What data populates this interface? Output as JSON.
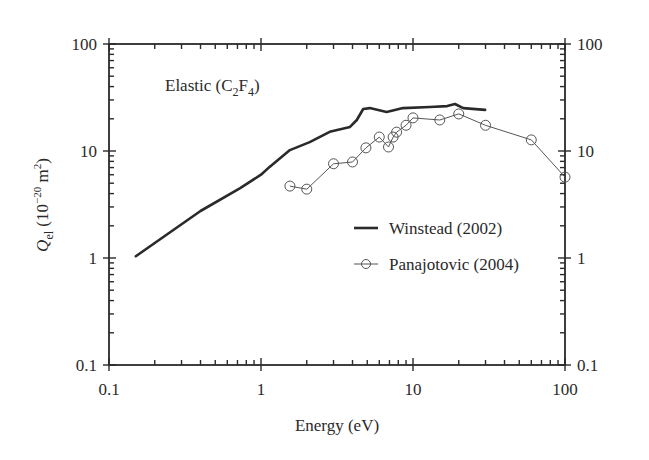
{
  "chart_data": {
    "type": "line",
    "title": "",
    "annotation": {
      "text": "Elastic (C",
      "sub1": "2",
      "mid": "F",
      "sub2": "4",
      "end": ")"
    },
    "xlabel": "Energy (eV)",
    "ylabel": {
      "symbol": "Q",
      "subscript": "el",
      "units_pre": " (10",
      "units_exp": "−20",
      "units_mid": " m",
      "units_exp2": "2",
      "units_end": ")"
    },
    "xscale": "log",
    "yscale": "log",
    "xlim": [
      0.1,
      100
    ],
    "ylim": [
      0.1,
      100
    ],
    "x_ticks": [
      "0.1",
      "1",
      "10",
      "100"
    ],
    "y_ticks": [
      "0.1",
      "1",
      "10",
      "100"
    ],
    "y_ticks_right": [
      "0.1",
      "1",
      "10",
      "100"
    ],
    "grid": false,
    "legend_position": "center-right",
    "series": [
      {
        "name": "Winstead (2002)",
        "style": "solid-thick",
        "color": "#2a2a2a",
        "x": [
          0.15,
          0.4,
          0.73,
          1.0,
          1.14,
          1.55,
          2.09,
          2.83,
          3.85,
          4.27,
          4.7,
          5.2,
          6.7,
          8.6,
          12.9,
          16.8,
          18.9,
          21.4,
          29.8
        ],
        "y": [
          1.04,
          2.75,
          4.5,
          6.0,
          7.1,
          10.2,
          12.1,
          15.1,
          16.8,
          19.5,
          24.7,
          25.2,
          23.2,
          25.2,
          25.8,
          26.3,
          27.5,
          25.2,
          24.2
        ]
      },
      {
        "name": "Panajotovic (2004)",
        "style": "thin-line-open-circles",
        "color": "#555555",
        "x": [
          1.55,
          2.0,
          3.0,
          4.0,
          4.9,
          6.0,
          6.9,
          7.4,
          7.8,
          9.0,
          10.0,
          15.0,
          20.0,
          30.0,
          60.0,
          100.0
        ],
        "y": [
          4.7,
          4.4,
          7.6,
          7.9,
          10.7,
          13.5,
          10.9,
          13.5,
          15.0,
          17.4,
          20.4,
          19.5,
          22.2,
          17.4,
          12.7,
          5.7
        ]
      }
    ]
  },
  "legend": {
    "items": [
      "Winstead (2002)",
      "Panajotovic (2004)"
    ]
  }
}
